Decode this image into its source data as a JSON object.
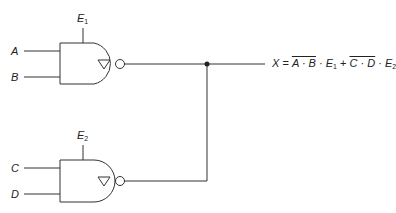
{
  "diagram": {
    "type": "logic-circuit",
    "gates": [
      {
        "id": "gate1",
        "kind": "NAND with open-collector output (∇ symbol)",
        "inputs": [
          "A",
          "B"
        ],
        "enable": {
          "label": "E",
          "subscript": "1"
        }
      },
      {
        "id": "gate2",
        "kind": "NAND with open-collector output (∇ symbol)",
        "inputs": [
          "C",
          "D"
        ],
        "enable": {
          "label": "E",
          "subscript": "2"
        }
      }
    ],
    "connection": "wired-OR junction of both gate outputs",
    "output": {
      "lhs": "X",
      "equals": " = ",
      "term1_overline": "A · B",
      "dot1": " · ",
      "term1_enable": "E",
      "term1_enable_sub": "1",
      "plus": " + ",
      "term2_overline": "C · D",
      "dot2": " · ",
      "term2_enable": "E",
      "term2_enable_sub": "2"
    },
    "labels": {
      "a": "A",
      "b": "B",
      "c": "C",
      "d": "D",
      "e1": "E",
      "e1_sub": "1",
      "e2": "E",
      "e2_sub": "2"
    },
    "colors": {
      "line": "#333333",
      "background": "#ffffff"
    }
  }
}
